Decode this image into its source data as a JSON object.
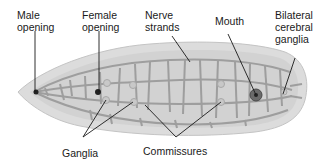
{
  "diagram": {
    "labels": {
      "male_opening": "Male\nopening",
      "female_opening": "Female\nopening",
      "nerve_strands": "Nerve\nstrands",
      "mouth": "Mouth",
      "bilateral_cerebral_ganglia": "Bilateral\ncerebral\nganglia",
      "ganglia": "Ganglia",
      "commissures": "Commissures"
    },
    "colors": {
      "body_fill": "#d9d9d9",
      "body_inner": "#cfcfcf",
      "nerve": "#9a9a9a",
      "leader_line": "#1a1a1a",
      "mouth": "#555555",
      "text": "#1a1a1a"
    }
  }
}
